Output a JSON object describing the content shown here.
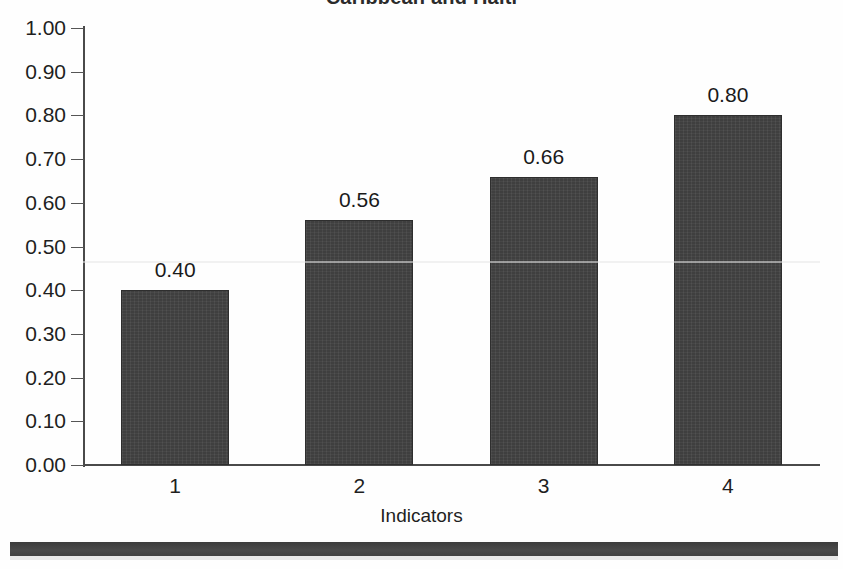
{
  "chart_data": {
    "type": "bar",
    "title": "Caribbean and Haiti",
    "xlabel": "Indicators",
    "ylabel": "",
    "categories": [
      "1",
      "2",
      "3",
      "4"
    ],
    "values": [
      0.4,
      0.56,
      0.66,
      0.8
    ],
    "value_labels": [
      "0.40",
      "0.56",
      "0.66",
      "0.80"
    ],
    "ylim": [
      0.0,
      1.0
    ],
    "ytick_labels": [
      "1.00",
      "0.90",
      "0.80",
      "0.70",
      "0.60",
      "0.50",
      "0.40",
      "0.30",
      "0.20",
      "0.10",
      "0.00"
    ],
    "ytick_values": [
      1.0,
      0.9,
      0.8,
      0.7,
      0.6,
      0.5,
      0.4,
      0.3,
      0.2,
      0.1,
      0.0
    ],
    "grid": false,
    "legend": null,
    "series": [
      {
        "name": "Indicators",
        "values": [
          0.4,
          0.56,
          0.66,
          0.8
        ]
      }
    ],
    "bar_color": "#3f3f3f",
    "axis_color": "#4a4a4a",
    "background_color": "#fefefe"
  }
}
